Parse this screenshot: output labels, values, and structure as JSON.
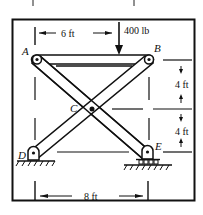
{
  "figure": {
    "type": "scissor-frame statics diagram",
    "load": {
      "label": "400 lb",
      "direction": "down"
    },
    "points": {
      "A": "A",
      "B": "B",
      "C": "C",
      "D": "D",
      "E": "E"
    },
    "dimensions": {
      "top": "6 ft",
      "right_upper": "4 ft",
      "right_lower": "4 ft",
      "bottom": "8 ft"
    },
    "supports": {
      "D": "pin support (fixed)",
      "E": "roller support"
    },
    "colors": {
      "ink": "#111111",
      "background": "#ffffff"
    }
  }
}
